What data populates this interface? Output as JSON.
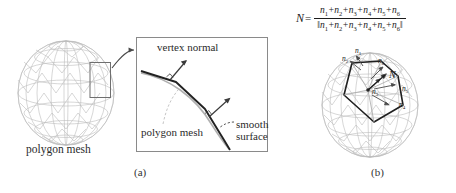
{
  "figure": {
    "panel_a": {
      "caption": "(a)",
      "sphere_label": "polygon mesh",
      "inset": {
        "vertex_normal_label": "vertex normal",
        "polygon_mesh_label": "polygon mesh",
        "smooth_label_line1": "smooth",
        "smooth_label_line2": "surface"
      }
    },
    "panel_b": {
      "caption": "(b)",
      "formula": {
        "lhs": "N",
        "equals": "=",
        "numerator_terms": [
          "n1",
          "n2",
          "n3",
          "n4",
          "n5",
          "n6"
        ],
        "denominator_norm_open": "||",
        "denominator_norm_close": "||",
        "plain_text": "N = (n1+n2+n3+n4+n5+n6) / ||n1+n2+n3+n4+n5+n6||"
      },
      "vector_labels": [
        {
          "id": "n1",
          "base": "n",
          "sub": "1"
        },
        {
          "id": "n2",
          "base": "n",
          "sub": "2"
        },
        {
          "id": "n3",
          "base": "n",
          "sub": "3"
        },
        {
          "id": "n4",
          "base": "n",
          "sub": "4"
        },
        {
          "id": "n5",
          "base": "n",
          "sub": "5"
        },
        {
          "id": "n6",
          "base": "n",
          "sub": "6"
        },
        {
          "id": "N",
          "base": "N",
          "sub": ""
        }
      ]
    }
  },
  "colors": {
    "background": "#ffffff",
    "mesh_line": "#b9b9b9",
    "mesh_line_dark": "#9a9a9a",
    "ink": "#1a1a1a",
    "box_border": "#8a8a8a",
    "dashed": "#7a7a7a"
  }
}
